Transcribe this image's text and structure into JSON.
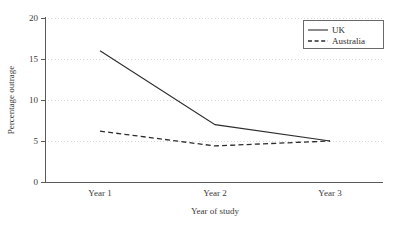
{
  "chart_data": {
    "type": "line",
    "title": "",
    "xlabel": "Year of study",
    "ylabel": "Percentage outrage",
    "categories": [
      "Year 1",
      "Year 2",
      "Year 3"
    ],
    "series": [
      {
        "name": "UK",
        "values": [
          16.0,
          7.0,
          5.0
        ],
        "style": "solid"
      },
      {
        "name": "Australia",
        "values": [
          6.2,
          4.4,
          5.0
        ],
        "style": "dashed"
      }
    ],
    "ylim": [
      0,
      20
    ],
    "yticks": [
      0,
      5,
      10,
      15,
      20
    ],
    "ytick_labels": [
      "0",
      "5",
      "10",
      "15",
      "20"
    ],
    "grid": "horizontal-dotted",
    "legend_position": "top-right",
    "colors": {
      "series_line": "#2c2c2c",
      "axis": "#5a5a5a",
      "gridline": "#d8d8d8",
      "background": "#ffffff",
      "text": "#2b2b2b"
    }
  },
  "legend": {
    "entries": [
      {
        "label": "UK"
      },
      {
        "label": "Australia"
      }
    ]
  },
  "axes": {
    "y_title": "Percentage outrage",
    "x_title": "Year of study",
    "y_tick_0": "0",
    "y_tick_5": "5",
    "y_tick_10": "10",
    "y_tick_15": "15",
    "y_tick_20": "20",
    "x_tick_1": "Year 1",
    "x_tick_2": "Year 2",
    "x_tick_3": "Year 3"
  }
}
